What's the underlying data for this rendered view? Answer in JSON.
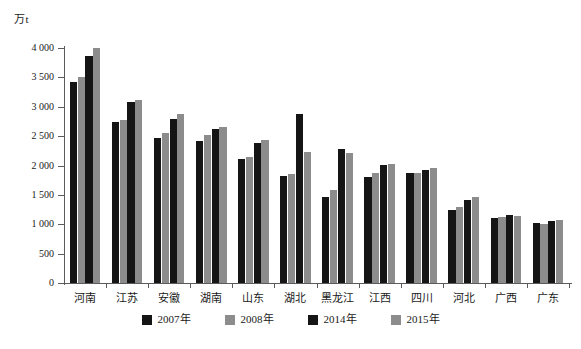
{
  "chart_data": {
    "type": "bar",
    "title": "",
    "xlabel": "",
    "ylabel": "万t",
    "unit_label": "万t",
    "ylim": [
      0,
      4000
    ],
    "ytick_values": [
      0,
      500,
      1000,
      1500,
      2000,
      2500,
      3000,
      3500,
      4000
    ],
    "ytick_labels": [
      "0",
      "500",
      "1 000",
      "1 500",
      "2 000",
      "2 500",
      "3 000",
      "3 500",
      "4 000"
    ],
    "grid": false,
    "legend_position": "bottom",
    "categories": [
      "河南",
      "江苏",
      "安徽",
      "湖南",
      "山东",
      "湖北",
      "黑龙江",
      "江西",
      "四川",
      "河北",
      "广西",
      "广东"
    ],
    "series": [
      {
        "name": "2007年",
        "color": "#151515",
        "values": [
          3430,
          2740,
          2470,
          2420,
          2110,
          1830,
          1470,
          1800,
          1870,
          1240,
          1110,
          1030
        ]
      },
      {
        "name": "2008年",
        "color": "#8c8c8c",
        "values": [
          3500,
          2775,
          2545,
          2520,
          2150,
          1850,
          1590,
          1880,
          1880,
          1290,
          1130,
          1010
        ]
      },
      {
        "name": "2014年",
        "color": "#151515",
        "values": [
          3860,
          3080,
          2800,
          2630,
          2390,
          2870,
          2280,
          2010,
          1930,
          1420,
          1150,
          1060
        ]
      },
      {
        "name": "2015年",
        "color": "#8c8c8c",
        "values": [
          4000,
          3120,
          2870,
          2650,
          2430,
          2230,
          2210,
          2030,
          1960,
          1470,
          1140,
          1070
        ]
      }
    ]
  },
  "legend": {
    "items": [
      {
        "label": "2007年",
        "color": "#151515"
      },
      {
        "label": "2008年",
        "color": "#8c8c8c"
      },
      {
        "label": "2014年",
        "color": "#151515"
      },
      {
        "label": "2015年",
        "color": "#8c8c8c"
      }
    ]
  },
  "caption": {
    "text": ""
  }
}
